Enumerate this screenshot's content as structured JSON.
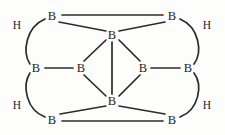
{
  "diagram": {
    "type": "chemical-structure",
    "width": 225,
    "height": 135,
    "background_color": "#fdfdfc",
    "bond_color": "#2b2b2b",
    "label_color": "#1d1d1d",
    "atoms": [
      {
        "id": "b-top-left",
        "element": "B",
        "x": 52,
        "y": 16
      },
      {
        "id": "b-top-right",
        "element": "B",
        "x": 172,
        "y": 16
      },
      {
        "id": "b-center-top",
        "element": "B",
        "x": 112,
        "y": 35
      },
      {
        "id": "b-left-outer",
        "element": "B",
        "x": 36,
        "y": 68
      },
      {
        "id": "b-left-inner",
        "element": "B",
        "x": 81,
        "y": 68
      },
      {
        "id": "b-right-inner",
        "element": "B",
        "x": 143,
        "y": 68
      },
      {
        "id": "b-right-outer",
        "element": "B",
        "x": 188,
        "y": 68
      },
      {
        "id": "b-center-bottom",
        "element": "B",
        "x": 112,
        "y": 101
      },
      {
        "id": "b-bottom-left",
        "element": "B",
        "x": 52,
        "y": 120
      },
      {
        "id": "b-bottom-right",
        "element": "B",
        "x": 172,
        "y": 120
      },
      {
        "id": "h-upper-left",
        "element": "H",
        "x": 17,
        "y": 25
      },
      {
        "id": "h-upper-right",
        "element": "H",
        "x": 207,
        "y": 25
      },
      {
        "id": "h-lower-left",
        "element": "H",
        "x": 17,
        "y": 105
      },
      {
        "id": "h-lower-right",
        "element": "H",
        "x": 207,
        "y": 105
      }
    ],
    "bonds": [
      {
        "id": "bond-top-edge",
        "from": "b-top-left",
        "to": "b-top-right",
        "x1": 62,
        "y1": 15,
        "x2": 163,
        "y2": 15
      },
      {
        "id": "bond-topleft-centertop",
        "from": "b-top-left",
        "to": "b-center-top",
        "x1": 59,
        "y1": 22,
        "x2": 106,
        "y2": 31
      },
      {
        "id": "bond-topright-centertop",
        "from": "b-top-right",
        "to": "b-center-top",
        "x1": 165,
        "y1": 22,
        "x2": 119,
        "y2": 31
      },
      {
        "id": "bond-centertop-leftinner",
        "from": "b-center-top",
        "to": "b-left-inner",
        "x1": 106,
        "y1": 40,
        "x2": 84,
        "y2": 61
      },
      {
        "id": "bond-centertop-rightinner",
        "from": "b-center-top",
        "to": "b-right-inner",
        "x1": 119,
        "y1": 40,
        "x2": 140,
        "y2": 61
      },
      {
        "id": "bond-centercolumn",
        "from": "b-center-top",
        "to": "b-center-bottom",
        "x1": 112,
        "y1": 42,
        "x2": 112,
        "y2": 94
      },
      {
        "id": "bond-leftouter-leftinner",
        "from": "b-left-outer",
        "to": "b-left-inner",
        "x1": 45,
        "y1": 68,
        "x2": 73,
        "y2": 68
      },
      {
        "id": "bond-rightinner-rightouter",
        "from": "b-right-inner",
        "to": "b-right-outer",
        "x1": 151,
        "y1": 68,
        "x2": 180,
        "y2": 68
      },
      {
        "id": "bond-leftinner-centerbottom",
        "from": "b-left-inner",
        "to": "b-center-bottom",
        "x1": 84,
        "y1": 75,
        "x2": 106,
        "y2": 96
      },
      {
        "id": "bond-rightinner-centerbottom",
        "from": "b-right-inner",
        "to": "b-center-bottom",
        "x1": 140,
        "y1": 75,
        "x2": 119,
        "y2": 96
      },
      {
        "id": "bond-centerbottom-bottomleft",
        "from": "b-center-bottom",
        "to": "b-bottom-left",
        "x1": 106,
        "y1": 106,
        "x2": 60,
        "y2": 114
      },
      {
        "id": "bond-centerbottom-bottomright",
        "from": "b-center-bottom",
        "to": "b-bottom-right",
        "x1": 119,
        "y1": 106,
        "x2": 165,
        "y2": 114
      },
      {
        "id": "bond-bottom-edge",
        "from": "b-bottom-left",
        "to": "b-bottom-right",
        "x1": 62,
        "y1": 121,
        "x2": 163,
        "y2": 121
      }
    ],
    "bridge_bonds": [
      {
        "id": "bridge-upper-left",
        "hydrogen": "h-upper-left",
        "from": "b-top-left",
        "to": "b-left-outer",
        "path": "M 45 19 C 26 27, 22 52, 30 64"
      },
      {
        "id": "bridge-upper-right",
        "hydrogen": "h-upper-right",
        "from": "b-top-right",
        "to": "b-right-outer",
        "path": "M 180 19 C 199 27, 203 52, 194 64"
      },
      {
        "id": "bridge-lower-left",
        "hydrogen": "h-lower-left",
        "from": "b-left-outer",
        "to": "b-bottom-left",
        "path": "M 30 73 C 22 85, 26 110, 45 117"
      },
      {
        "id": "bridge-lower-right",
        "hydrogen": "h-lower-right",
        "from": "b-right-outer",
        "to": "b-bottom-right",
        "path": "M 194 73 C 203 85, 199 110, 180 117"
      }
    ]
  }
}
